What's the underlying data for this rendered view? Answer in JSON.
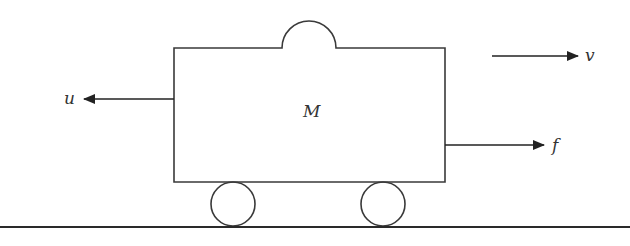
{
  "diagram": {
    "type": "cart-mass-system",
    "colors": {
      "stroke": "#3a3a3a",
      "background": "#ffffff",
      "text": "#333333"
    },
    "cart": {
      "mass_label": "M"
    },
    "arrows": {
      "u": {
        "label": "u",
        "direction": "left"
      },
      "v": {
        "label": "v",
        "direction": "right"
      },
      "f": {
        "label": "f",
        "direction": "right"
      }
    },
    "wheels": [
      {
        "id": "wheel-left"
      },
      {
        "id": "wheel-right"
      }
    ],
    "ground": {
      "present": true
    }
  }
}
